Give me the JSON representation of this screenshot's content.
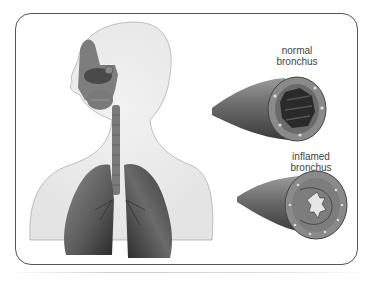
{
  "figure": {
    "labels": {
      "normal_line1": "normal",
      "normal_line2": "bronchus",
      "inflamed_line1": "inflamed",
      "inflamed_line2": "bronchus"
    },
    "colors": {
      "frame": "#555555",
      "body_fill": "#eeeeee",
      "tissue_dark": "#3a3a3a",
      "tissue_mid": "#7a7a7a",
      "text": "#444444"
    }
  }
}
